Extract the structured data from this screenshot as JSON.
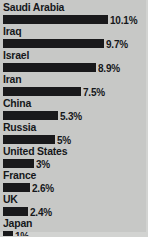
{
  "chart_data": {
    "type": "bar",
    "title": "",
    "subtitle": "",
    "xlabel": "",
    "ylabel": "",
    "orientation": "horizontal",
    "grid": false,
    "legend": null,
    "xlim": [
      0,
      10.1
    ],
    "categories": [
      "Saudi Arabia",
      "Iraq",
      "Israel",
      "Iran",
      "China",
      "Russia",
      "United States",
      "France",
      "UK",
      "Japan"
    ],
    "values": [
      10.1,
      9.7,
      8.9,
      7.5,
      5.3,
      5,
      3,
      2.6,
      2.4,
      1
    ],
    "value_labels": [
      "10.1%",
      "9.7%",
      "8.9%",
      "7.5%",
      "5.3%",
      "5%",
      "3%",
      "2.6%",
      "2.4%",
      "1%"
    ],
    "bars": [
      {
        "label": "Saudi Arabia",
        "value": 10.1,
        "value_label": "10.1%",
        "width_px": 105
      },
      {
        "label": "Iraq",
        "value": 9.7,
        "value_label": "9.7%",
        "width_px": 101
      },
      {
        "label": "Israel",
        "value": 8.9,
        "value_label": "8.9%",
        "width_px": 93
      },
      {
        "label": "Iran",
        "value": 7.5,
        "value_label": "7.5%",
        "width_px": 78
      },
      {
        "label": "China",
        "value": 5.3,
        "value_label": "5.3%",
        "width_px": 55
      },
      {
        "label": "Russia",
        "value": 5,
        "value_label": "5%",
        "width_px": 52
      },
      {
        "label": "United States",
        "value": 3,
        "value_label": "3%",
        "width_px": 31
      },
      {
        "label": "France",
        "value": 2.6,
        "value_label": "2.6%",
        "width_px": 27
      },
      {
        "label": "UK",
        "value": 2.4,
        "value_label": "2.4%",
        "width_px": 25
      },
      {
        "label": "Japan",
        "value": 1,
        "value_label": "1%",
        "width_px": 10
      }
    ],
    "colors": {
      "background": "#c7c8c6",
      "bar": "#19191b",
      "text": "#15171a",
      "border": "#d2d3d1"
    }
  }
}
